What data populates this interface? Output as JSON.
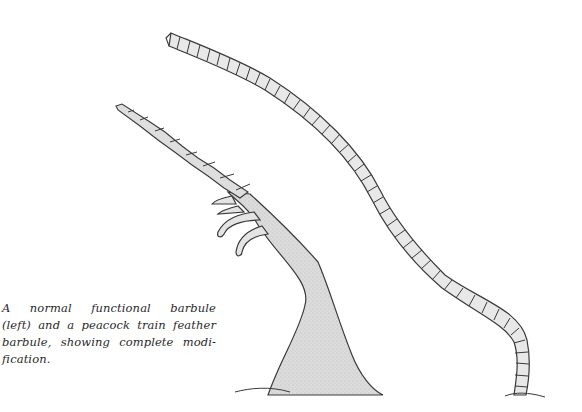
{
  "figure": {
    "subjects": [
      {
        "name": "normal functional barbule",
        "position": "left"
      },
      {
        "name": "peacock train feather barbule",
        "position": "right"
      }
    ],
    "colors": {
      "ink": "#3a3a3a",
      "shading": "#d6d6d6",
      "segment_fill": "#e6e6e6",
      "background": "#ffffff"
    }
  },
  "caption": {
    "lines": [
      "A normal functional barbule",
      "(left) and a peacock train feather",
      "barbule, showing complete modi-",
      "fication."
    ]
  }
}
